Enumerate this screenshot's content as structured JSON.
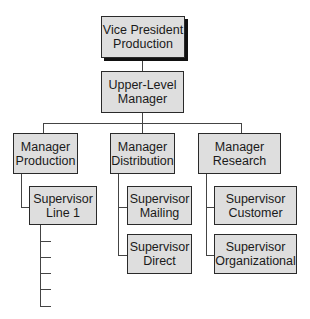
{
  "org_chart": {
    "top": {
      "line1": "Vice President",
      "line2": "Production"
    },
    "upper": {
      "line1": "Upper-Level",
      "line2": "Manager"
    },
    "managers": [
      {
        "line1": "Manager",
        "line2": "Production"
      },
      {
        "line1": "Manager",
        "line2": "Distribution"
      },
      {
        "line1": "Manager",
        "line2": "Research"
      }
    ],
    "supervisors": {
      "production": [
        {
          "line1": "Supervisor",
          "line2": "Line 1"
        }
      ],
      "distribution": [
        {
          "line1": "Supervisor",
          "line2": "Mailing"
        },
        {
          "line1": "Supervisor",
          "line2": "Direct"
        }
      ],
      "research": [
        {
          "line1": "Supervisor",
          "line2": "Customer"
        },
        {
          "line1": "Supervisor",
          "line2": "Organizational"
        }
      ]
    },
    "unlabeled_subordinate_ticks": 5
  }
}
